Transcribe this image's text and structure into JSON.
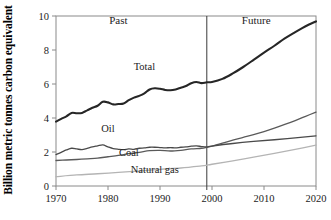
{
  "chart_data": {
    "type": "line",
    "title": "",
    "subtitle": "",
    "xlabel": "",
    "ylabel": "Billion metric tonnes carbon equivalent",
    "xlim": [
      1970,
      2020
    ],
    "ylim": [
      0,
      10
    ],
    "grid": false,
    "legend_position": "inline-labels",
    "xticks": [
      1970,
      1980,
      1990,
      2000,
      2010,
      2020
    ],
    "xtick_labels": [
      "1970",
      "1980",
      "1990",
      "2000",
      "2010",
      "2020"
    ],
    "yticks": [
      0,
      2,
      4,
      6,
      8,
      10
    ],
    "ytick_labels": [
      "0",
      "2",
      "4",
      "6",
      "8",
      "10"
    ],
    "annotations": [
      {
        "text": "Past",
        "x": 1982,
        "y": 9.55
      },
      {
        "text": "Future",
        "x": 2008.5,
        "y": 9.55
      },
      {
        "text": "Total",
        "x": 1987,
        "y": 6.85
      },
      {
        "text": "Oil",
        "x": 1980,
        "y": 3.2
      },
      {
        "text": "Coal",
        "x": 1984,
        "y": 1.75
      },
      {
        "text": "Natural gas",
        "x": 1989,
        "y": 0.78
      }
    ],
    "divider": {
      "x": 1999,
      "label": "past-future-divider",
      "color": "#3a3a3a"
    },
    "series": [
      {
        "name": "Total",
        "color": "#262626",
        "width": 2.1,
        "x": [
          1970,
          1971,
          1972,
          1973,
          1974,
          1975,
          1976,
          1977,
          1978,
          1979,
          1980,
          1981,
          1982,
          1983,
          1984,
          1985,
          1986,
          1987,
          1988,
          1989,
          1990,
          1991,
          1992,
          1993,
          1994,
          1995,
          1996,
          1997,
          1998,
          1999,
          2000,
          2002,
          2004,
          2006,
          2008,
          2010,
          2012,
          2014,
          2016,
          2018,
          2020
        ],
        "values": [
          3.79,
          3.95,
          4.1,
          4.3,
          4.28,
          4.3,
          4.45,
          4.6,
          4.72,
          4.95,
          4.92,
          4.8,
          4.82,
          4.85,
          5.05,
          5.2,
          5.3,
          5.45,
          5.68,
          5.75,
          5.72,
          5.65,
          5.63,
          5.68,
          5.78,
          5.88,
          6.05,
          6.12,
          6.05,
          6.1,
          6.12,
          6.3,
          6.62,
          7.0,
          7.42,
          7.85,
          8.25,
          8.68,
          9.05,
          9.4,
          9.68
        ]
      },
      {
        "name": "Coal",
        "color": "#5a5a5a",
        "width": 1.3,
        "x": [
          1970,
          1972,
          1974,
          1976,
          1978,
          1980,
          1982,
          1984,
          1986,
          1988,
          1990,
          1992,
          1994,
          1996,
          1998,
          1999,
          2000,
          2002,
          2004,
          2006,
          2008,
          2010,
          2012,
          2014,
          2016,
          2018,
          2020
        ],
        "values": [
          1.5,
          1.53,
          1.56,
          1.6,
          1.64,
          1.72,
          1.8,
          1.9,
          1.98,
          2.08,
          2.1,
          2.06,
          2.1,
          2.18,
          2.22,
          2.28,
          2.35,
          2.52,
          2.7,
          2.86,
          3.02,
          3.2,
          3.4,
          3.62,
          3.85,
          4.1,
          4.35
        ]
      },
      {
        "name": "Oil",
        "color": "#4a4a4a",
        "width": 1.3,
        "x": [
          1970,
          1971,
          1972,
          1973,
          1974,
          1975,
          1976,
          1977,
          1978,
          1979,
          1980,
          1981,
          1982,
          1983,
          1984,
          1985,
          1986,
          1987,
          1988,
          1989,
          1990,
          1991,
          1992,
          1993,
          1994,
          1995,
          1996,
          1997,
          1998,
          1999,
          2000,
          2004,
          2008,
          2012,
          2016,
          2020
        ],
        "values": [
          1.85,
          1.98,
          2.12,
          2.22,
          2.18,
          2.14,
          2.22,
          2.3,
          2.36,
          2.42,
          2.3,
          2.2,
          2.16,
          2.14,
          2.18,
          2.16,
          2.22,
          2.24,
          2.28,
          2.28,
          2.26,
          2.24,
          2.26,
          2.24,
          2.28,
          2.3,
          2.34,
          2.36,
          2.32,
          2.3,
          2.35,
          2.5,
          2.62,
          2.72,
          2.83,
          2.95
        ]
      },
      {
        "name": "Natural gas",
        "color": "#b4b4b4",
        "width": 1.3,
        "x": [
          1970,
          1974,
          1978,
          1982,
          1986,
          1990,
          1994,
          1998,
          1999,
          2000,
          2004,
          2008,
          2012,
          2016,
          2020
        ],
        "values": [
          0.55,
          0.65,
          0.72,
          0.8,
          0.88,
          0.98,
          1.06,
          1.18,
          1.22,
          1.28,
          1.48,
          1.7,
          1.92,
          2.15,
          2.4
        ]
      }
    ]
  }
}
